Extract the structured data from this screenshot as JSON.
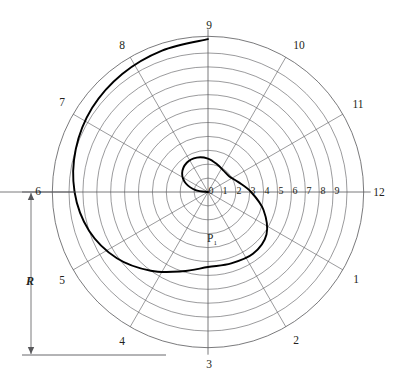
{
  "figure": {
    "background_color": "#ffffff",
    "grid_color": "#58585b",
    "axis_color": "#58585b",
    "curve_color": "#000000",
    "text_color": "#231f20"
  },
  "angular_labels": [
    {
      "text": "1",
      "angle_deg": 30,
      "x": 356,
      "y": 279
    },
    {
      "text": "2",
      "angle_deg": 60,
      "x": 296,
      "y": 340
    },
    {
      "text": "3",
      "angle_deg": 90,
      "x": 209,
      "y": 364
    },
    {
      "text": "4",
      "angle_deg": 120,
      "x": 122,
      "y": 341
    },
    {
      "text": "5",
      "angle_deg": 150,
      "x": 62,
      "y": 280
    },
    {
      "text": "6",
      "angle_deg": 180,
      "x": 38,
      "y": 191
    },
    {
      "text": "7",
      "angle_deg": 210,
      "x": 62,
      "y": 102
    },
    {
      "text": "8",
      "angle_deg": 240,
      "x": 122,
      "y": 45
    },
    {
      "text": "9",
      "angle_deg": 270,
      "x": 209,
      "y": 25
    },
    {
      "text": "10",
      "angle_deg": 300,
      "x": 299,
      "y": 45
    },
    {
      "text": "11",
      "angle_deg": 330,
      "x": 358,
      "y": 104
    },
    {
      "text": "12",
      "angle_deg": 0,
      "x": 379,
      "y": 192
    }
  ],
  "radial_labels": [
    {
      "text": "0",
      "value": 0,
      "x": 211,
      "y": 190
    },
    {
      "text": "1",
      "value": 1,
      "x": 225,
      "y": 190
    },
    {
      "text": "2",
      "value": 2,
      "x": 239,
      "y": 190
    },
    {
      "text": "3",
      "value": 3,
      "x": 253,
      "y": 190
    },
    {
      "text": "4",
      "value": 4,
      "x": 267,
      "y": 190
    },
    {
      "text": "5",
      "value": 5,
      "x": 281,
      "y": 190
    },
    {
      "text": "6",
      "value": 6,
      "x": 295,
      "y": 190
    },
    {
      "text": "7",
      "value": 7,
      "x": 309,
      "y": 190
    },
    {
      "text": "8",
      "value": 8,
      "x": 323,
      "y": 190
    },
    {
      "text": "9",
      "value": 9,
      "x": 337,
      "y": 190
    }
  ],
  "point_labels": [
    {
      "name": "P1",
      "base": "P",
      "sub": "1",
      "x": 212,
      "y": 241
    }
  ],
  "dimension": {
    "label": "R",
    "label_x": 30,
    "label_y": 281,
    "arrow_x": 31,
    "arrow_top_y": 193,
    "arrow_bottom_y": 354,
    "top_tick_x1": 22,
    "top_tick_x2": 75,
    "top_tick_y": 192,
    "bottom_tick_x1": 22,
    "bottom_tick_x2": 166,
    "bottom_tick_y": 355
  },
  "chart_data": {
    "type": "line",
    "subtype": "polar-spiral",
    "xlabel": "",
    "ylabel": "",
    "grid": true,
    "legend": false,
    "center_px": {
      "x": 208,
      "y": 192
    },
    "px_per_unit": 13.9,
    "radial_axis": {
      "label_values": [
        0,
        1,
        2,
        3,
        4,
        5,
        6,
        7,
        8,
        9
      ],
      "ring_values": [
        1,
        2,
        3,
        4,
        5,
        6,
        7,
        8,
        9,
        10,
        11.2
      ],
      "rlim": [
        0,
        11.2
      ],
      "tick_labels": [
        "0",
        "1",
        "2",
        "3",
        "4",
        "5",
        "6",
        "7",
        "8",
        "9"
      ]
    },
    "angular_axis": {
      "divisions": 12,
      "step_deg": 30,
      "direction": "clockwise",
      "zero_at": "east",
      "tick_labels": [
        "12",
        "1",
        "2",
        "3",
        "4",
        "5",
        "6",
        "7",
        "8",
        "9",
        "10",
        "11"
      ]
    },
    "series": [
      {
        "name": "spiral",
        "description": "Spiral starting at the pole, through P1, winding counterclockwise outward to station 12",
        "closed": false,
        "points_polar": [
          {
            "station": 0.0,
            "angle_deg": 270,
            "r": 0.0
          },
          {
            "station": 0.3,
            "angle_deg": 279,
            "r": 0.9
          },
          {
            "station": 0.7,
            "angle_deg": 291,
            "r": 1.7
          },
          {
            "station": 1.2,
            "angle_deg": 306,
            "r": 2.3
          },
          {
            "station": 1.8,
            "angle_deg": 324,
            "r": 2.6
          },
          {
            "station": 2.4,
            "angle_deg": 342,
            "r": 2.6
          },
          {
            "station": 3.0,
            "angle_deg": 360,
            "r": 2.4
          },
          {
            "station": 3.6,
            "angle_deg": 378,
            "r": 2.1
          },
          {
            "station": 4.2,
            "angle_deg": 396,
            "r": 1.9
          },
          {
            "station": 4.8,
            "angle_deg": 414,
            "r": 1.9
          },
          {
            "station": 5.4,
            "angle_deg": 432,
            "r": 2.3
          },
          {
            "station": 6.0,
            "angle_deg": 450,
            "r": 3.1
          },
          {
            "station": 6.6,
            "angle_deg": 468,
            "r": 4.2
          },
          {
            "station": 7.2,
            "angle_deg": 486,
            "r": 5.2
          },
          {
            "station": 7.8,
            "angle_deg": 504,
            "r": 5.5
          },
          {
            "station": 8.4,
            "angle_deg": 522,
            "r": 5.4
          },
          {
            "station": 9.0,
            "angle_deg": 540,
            "r": 5.4
          },
          {
            "station": 9.6,
            "angle_deg": 558,
            "r": 6.0
          },
          {
            "station": 10.2,
            "angle_deg": 576,
            "r": 7.0
          },
          {
            "station": 10.8,
            "angle_deg": 594,
            "r": 8.1
          },
          {
            "station": 11.4,
            "angle_deg": 612,
            "r": 9.0
          },
          {
            "station": 12.0,
            "angle_deg": 630,
            "r": 9.6
          },
          {
            "station": 12.6,
            "angle_deg": 648,
            "r": 10.0
          },
          {
            "station": 13.2,
            "angle_deg": 666,
            "r": 10.3
          },
          {
            "station": 13.8,
            "angle_deg": 684,
            "r": 10.5
          },
          {
            "station": 14.4,
            "angle_deg": 702,
            "r": 10.7
          },
          {
            "station": 15.0,
            "angle_deg": 720,
            "r": 11.0
          }
        ],
        "marked_points": [
          {
            "label": "P1",
            "angle_deg": 95,
            "r": 3.5
          }
        ]
      }
    ],
    "annotations": [
      {
        "text": "R",
        "type": "dimension",
        "meaning": "overall radius dimension at left side"
      },
      {
        "text": "P1",
        "type": "point-label",
        "meaning": "labelled point on spiral near bottom of inner loop"
      }
    ]
  }
}
